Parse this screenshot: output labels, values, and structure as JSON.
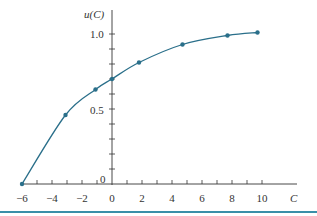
{
  "chart_data": {
    "type": "line",
    "title": "",
    "xlabel": "C",
    "ylabel": "u(C)",
    "xlim": [
      -6,
      11.5
    ],
    "ylim": [
      0,
      1.1
    ],
    "x_ticks": [
      -6,
      -4,
      -2,
      0,
      2,
      4,
      6,
      8,
      10
    ],
    "x_tick_labels": [
      "−6",
      "−4",
      "−2",
      "0",
      "2",
      "4",
      "6",
      "8",
      "10"
    ],
    "y_tick_labels": [
      {
        "value": 0,
        "label": "0"
      },
      {
        "value": 0.5,
        "label": "0.5"
      },
      {
        "value": 1.0,
        "label": "1.0"
      }
    ],
    "minor_x_step": 1,
    "minor_y_step": 0.1,
    "grid": false,
    "legend": null,
    "series": [
      {
        "name": "u(C)",
        "color": "#2a6f8a",
        "points": [
          {
            "x": -6,
            "y": 0.0
          },
          {
            "x": -3.1,
            "y": 0.46
          },
          {
            "x": -1.1,
            "y": 0.63
          },
          {
            "x": 0,
            "y": 0.7
          },
          {
            "x": 1.8,
            "y": 0.81
          },
          {
            "x": 4.7,
            "y": 0.93
          },
          {
            "x": 7.7,
            "y": 0.99
          },
          {
            "x": 9.7,
            "y": 1.01
          }
        ]
      }
    ]
  },
  "labels": {
    "y_axis": "u(C)",
    "x_axis": "C",
    "y_one": "1.0",
    "y_half": "0.5",
    "y_zero": "0"
  },
  "colors": {
    "curve": "#2a6f8a",
    "axis": "#333333",
    "bottom_rule": "#3a8fa8"
  }
}
